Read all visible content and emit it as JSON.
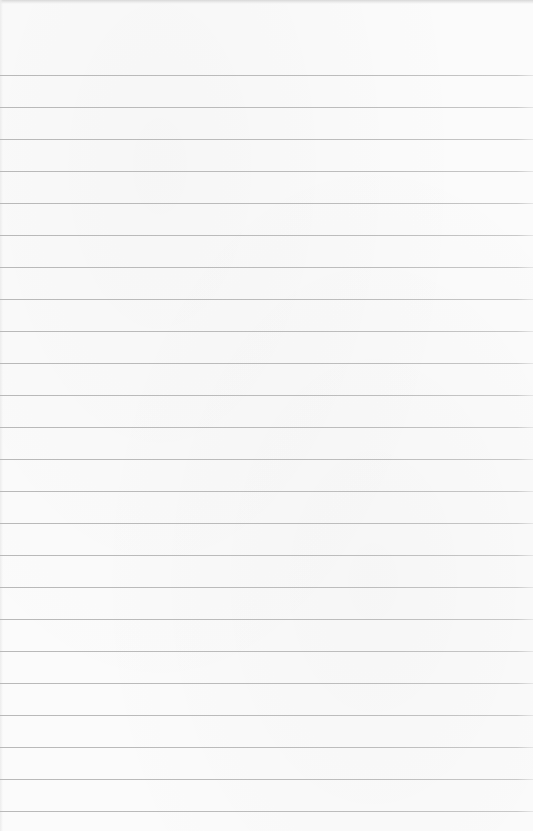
{
  "paper": {
    "type": "ruled notebook paper",
    "background_color": "#fbfbfb",
    "line_color": "#bcbcbc",
    "top_edge_color": "#d8d8d8",
    "first_line_y": 75,
    "line_spacing": 32,
    "line_count": 24,
    "text": ""
  }
}
